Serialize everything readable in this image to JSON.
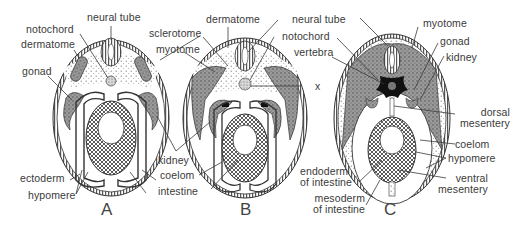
{
  "figure": {
    "panels": [
      {
        "id": "A",
        "letter": "A",
        "labels": {
          "neural_tube": "neural tube",
          "notochord": "notochord",
          "dermatome": "dermatome",
          "gonad": "gonad",
          "ectoderm": "ectoderm",
          "hypomere": "hypomere"
        }
      },
      {
        "id": "B",
        "letter": "B",
        "labels": {
          "sclerotome": "sclerotome",
          "myotome": "myotome",
          "dermatome": "dermatome",
          "kidney": "kidney",
          "coelom": "coelom",
          "intestine": "intestine",
          "x": "x"
        }
      },
      {
        "id": "C",
        "letter": "C",
        "labels": {
          "neural_tube": "neural tube",
          "notochord": "notochord",
          "vertebra": "vertebra",
          "myotome": "myotome",
          "gonad": "gonad",
          "kidney": "kidney",
          "dorsal_mesentery": "dorsal\nmesentery",
          "coelom": "coelom",
          "hypomere": "hypomere",
          "ventral_mesentery": "ventral\nmesentery",
          "endoderm_of_intestine": "endoderm\nof intestine",
          "mesoderm_of_intestine": "mesoderm\nof intestine"
        }
      }
    ]
  },
  "colors": {
    "line": "#3a3a3a",
    "hatch": "#5a5a5a",
    "stipple": "#8a8a8a",
    "dark": "#1a1a1a",
    "background": "#ffffff"
  }
}
